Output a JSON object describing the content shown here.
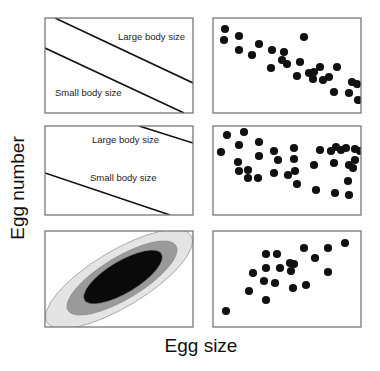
{
  "figure": {
    "xlabel": "Egg size",
    "ylabel": "Egg number",
    "colors": {
      "frame": "#777777",
      "ink": "#111111",
      "ellipse_outer": "#e4e4e4",
      "ellipse_middle": "#9a9a9a",
      "ellipse_inner": "#0a0a0a"
    }
  },
  "chart_data": [
    {
      "panel": "row1-left",
      "type": "line",
      "title": "",
      "xlabel": "",
      "ylabel": "",
      "frame": [
        45,
        18,
        148,
        95
      ],
      "series": [
        {
          "name": "Large body size",
          "points": [
            [
              55,
              18
            ],
            [
              193,
              83
            ]
          ]
        },
        {
          "name": "Small body size",
          "points": [
            [
              45,
              48
            ],
            [
              184,
              113
            ]
          ]
        }
      ],
      "annotations": [
        {
          "text": "Large body size",
          "x": 118,
          "y": 40
        },
        {
          "text": "Small body size",
          "x": 55,
          "y": 96
        }
      ]
    },
    {
      "panel": "row1-right",
      "type": "scatter",
      "frame": [
        213,
        18,
        148,
        95
      ],
      "trend": "negative",
      "points": [
        [
          225,
          29
        ],
        [
          224,
          40
        ],
        [
          239,
          36
        ],
        [
          239,
          50
        ],
        [
          259,
          44
        ],
        [
          252,
          55
        ],
        [
          272,
          50
        ],
        [
          271,
          68
        ],
        [
          284,
          52
        ],
        [
          282,
          60
        ],
        [
          287,
          64
        ],
        [
          304,
          37
        ],
        [
          300,
          62
        ],
        [
          297,
          76
        ],
        [
          309,
          73
        ],
        [
          314,
          72
        ],
        [
          320,
          67
        ],
        [
          313,
          79
        ],
        [
          323,
          80
        ],
        [
          329,
          77
        ],
        [
          334,
          92
        ],
        [
          337,
          67
        ],
        [
          352,
          82
        ],
        [
          357,
          84
        ],
        [
          349,
          93
        ],
        [
          358,
          100
        ]
      ]
    },
    {
      "panel": "row2-left",
      "type": "line",
      "frame": [
        45,
        126,
        148,
        89
      ],
      "series": [
        {
          "name": "Large body size",
          "points": [
            [
              139,
              126
            ],
            [
              193,
              143
            ]
          ]
        },
        {
          "name": "Small body size",
          "points": [
            [
              45,
              173
            ],
            [
              170,
              215
            ]
          ]
        }
      ],
      "annotations": [
        {
          "text": "Large body size",
          "x": 92,
          "y": 143
        },
        {
          "text": "Small body size",
          "x": 90,
          "y": 181
        }
      ]
    },
    {
      "panel": "row2-right",
      "type": "scatter",
      "frame": [
        213,
        126,
        148,
        89
      ],
      "trend": "none",
      "points": [
        [
          221,
          152
        ],
        [
          227,
          135
        ],
        [
          244,
          132
        ],
        [
          239,
          145
        ],
        [
          238,
          162
        ],
        [
          239,
          171
        ],
        [
          248,
          170
        ],
        [
          248,
          178
        ],
        [
          259,
          142
        ],
        [
          259,
          156
        ],
        [
          258,
          178
        ],
        [
          274,
          151
        ],
        [
          278,
          160
        ],
        [
          274,
          173
        ],
        [
          294,
          148
        ],
        [
          294,
          159
        ],
        [
          288,
          175
        ],
        [
          297,
          184
        ],
        [
          295,
          171
        ],
        [
          314,
          165
        ],
        [
          316,
          190
        ],
        [
          320,
          150
        ],
        [
          331,
          151
        ],
        [
          334,
          163
        ],
        [
          336,
          147
        ],
        [
          341,
          150
        ],
        [
          335,
          193
        ],
        [
          346,
          148
        ],
        [
          349,
          165
        ],
        [
          353,
          168
        ],
        [
          348,
          181
        ],
        [
          349,
          195
        ],
        [
          355,
          149
        ],
        [
          355,
          160
        ],
        [
          360,
          151
        ]
      ]
    },
    {
      "panel": "row3-left",
      "type": "area",
      "description": "Nested elliptical density contours, positive correlation",
      "frame": [
        45,
        231,
        148,
        96
      ],
      "contours": [
        {
          "level": "outer",
          "cx": 119,
          "cy": 279,
          "rx": 84,
          "ry": 28,
          "angle": -31
        },
        {
          "level": "middle",
          "cx": 122,
          "cy": 278,
          "rx": 63,
          "ry": 21,
          "angle": -31
        },
        {
          "level": "inner",
          "cx": 123,
          "cy": 277,
          "rx": 45,
          "ry": 16,
          "angle": -31
        }
      ]
    },
    {
      "panel": "row3-right",
      "type": "scatter",
      "frame": [
        213,
        231,
        148,
        96
      ],
      "trend": "positive",
      "points": [
        [
          226,
          311
        ],
        [
          249,
          291
        ],
        [
          253,
          273
        ],
        [
          266,
          254
        ],
        [
          266,
          268
        ],
        [
          264,
          281
        ],
        [
          266,
          300
        ],
        [
          275,
          283
        ],
        [
          277,
          254
        ],
        [
          280,
          268
        ],
        [
          290,
          263
        ],
        [
          294,
          264
        ],
        [
          291,
          271
        ],
        [
          293,
          288
        ],
        [
          304,
          248
        ],
        [
          306,
          285
        ],
        [
          315,
          258
        ],
        [
          328,
          248
        ],
        [
          328,
          272
        ],
        [
          345,
          243
        ]
      ]
    }
  ]
}
